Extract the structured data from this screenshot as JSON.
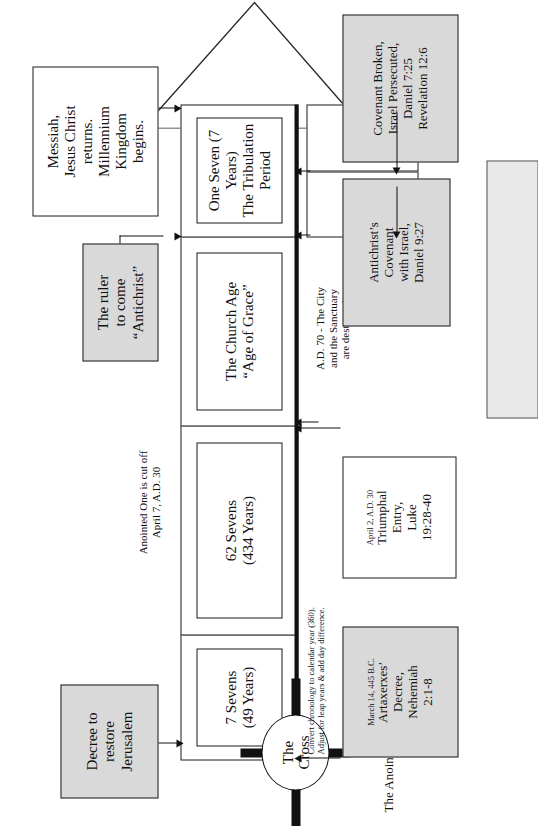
{
  "diagram": {
    "title_note": "The Anointed One, The Messiah",
    "cross": {
      "line1": "The",
      "line2": "Cross",
      "caption_line1": "Anointed One is cut off",
      "caption_line2": "April 7, A.D. 30"
    },
    "segments": [
      {
        "id": "seven-sevens",
        "line1": "7 Sevens",
        "line2": "(49 Years)"
      },
      {
        "id": "sixtytwo-sevens",
        "line1": "62 Sevens",
        "line2": "(434 Years)"
      },
      {
        "id": "church-age",
        "line1": "The Church Age",
        "line2": "“Age of Grace”"
      },
      {
        "id": "tribulation",
        "line1": "One Seven (7 Years)",
        "line2": "The Tribulation Period"
      }
    ],
    "left_boxes": {
      "decree": "Decree to\nrestore\nJerusalem",
      "decree_lines": [
        "Decree to",
        "restore",
        "Jerusalem"
      ],
      "antichrist_lines": [
        "The ruler",
        "to come",
        "“Antichrist”"
      ],
      "return_lines": [
        "Messiah,",
        "Jesus Christ",
        "returns.",
        "Millennium",
        "Kingdom",
        "begins."
      ]
    },
    "below_notes": {
      "convert_line1": "Convert chronology to calendar year (360).",
      "convert_line2": "Adjust for leap years & add day difference.",
      "ad70_line1": "A.D. 70 - The City",
      "ad70_line2": "and the Sanctuary",
      "ad70_line3": "are destroyed.",
      "half_week_1_line1": "3 1/2 yrs./42 mons.",
      "half_week_1_line2": "/1260 days",
      "half_week_2_line1": "3 1/2 yrs./42 mons.",
      "half_week_2_line2": "/1260 days"
    },
    "bottom_boxes": {
      "artaxerxes_date": "March 14, 445 B.C.",
      "artaxerxes_lines": [
        "Artaxerxes’",
        "Decree,",
        "Nehemiah",
        "2:1-8"
      ],
      "triumphal_date": "April 2, A.D. 30",
      "triumphal_lines": [
        "Triumphal",
        "Entry,",
        "Luke",
        "19:28-40"
      ],
      "covenant_lines": [
        "Antichrist’s",
        "Covenant",
        "with Israel,",
        "Daniel 9:27"
      ],
      "broken_lines": [
        "Covenant Broken,",
        "Israel Persecuted,",
        "Daniel 7:25",
        "Revelation 12:6"
      ]
    },
    "colors": {
      "ink": "#111111",
      "paper": "#ffffff",
      "fill_gray": "#d9d9d9"
    }
  }
}
